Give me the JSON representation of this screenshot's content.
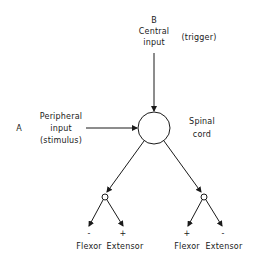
{
  "diagram": {
    "central_input": {
      "letter": "B",
      "line1": "Central",
      "line2": "input",
      "note": "(trigger)"
    },
    "peripheral_input": {
      "letter": "A",
      "line1": "Peripheral",
      "line2": "input",
      "line3": "(stimulus)"
    },
    "center_node": {
      "line1": "Spinal",
      "line2": "cord"
    },
    "left_branch": {
      "flexor": {
        "sign": "-",
        "label": "Flexor"
      },
      "extensor": {
        "sign": "+",
        "label": "Extensor"
      }
    },
    "right_branch": {
      "flexor": {
        "sign": "+",
        "label": "Flexor"
      },
      "extensor": {
        "sign": "-",
        "label": "Extensor"
      }
    },
    "colors": {
      "stroke": "#1a1a1a",
      "background": "#ffffff"
    }
  }
}
